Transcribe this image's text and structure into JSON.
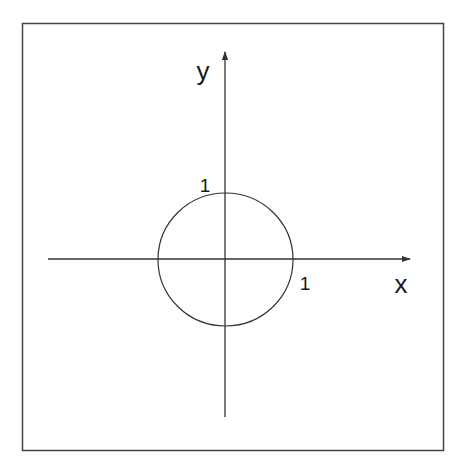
{
  "diagram": {
    "type": "unit-circle",
    "colors": {
      "background": "#ffffff",
      "stroke": "#333333",
      "text": "#1a1a1a"
    },
    "frame": {
      "x": 22,
      "y": 23,
      "width": 422,
      "height": 428
    },
    "axes": {
      "x": {
        "label": "x",
        "from": [
          48,
          259
        ],
        "to": [
          410,
          259
        ]
      },
      "y": {
        "label": "y",
        "from": [
          225,
          417
        ],
        "to": [
          225,
          52
        ]
      }
    },
    "circle": {
      "cx": 225,
      "cy": 259.5,
      "rx": 67,
      "ry": 66.5,
      "radius_value": 1
    },
    "tick_labels": {
      "x_one": "1",
      "y_one": "1"
    }
  }
}
